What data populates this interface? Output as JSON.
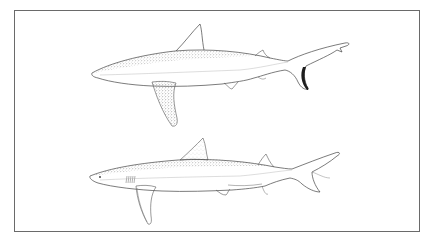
{
  "figure": {
    "frame_color": "#6a6a6a",
    "ink_color": "#3a3a3a",
    "stipple_color": "#555555",
    "dark_tail_accent": "#1e1e1e",
    "subjects": [
      {
        "position": "top",
        "label": "shark-upper",
        "orientation": "facing-left",
        "features": [
          "first-dorsal-fin",
          "long-pectoral-fin-stippled",
          "second-dorsal-fin",
          "pelvic-fin",
          "anal-fin",
          "dark-lower-caudal-lobe-edge"
        ]
      },
      {
        "position": "bottom",
        "label": "shark-lower",
        "orientation": "facing-left",
        "features": [
          "first-dorsal-fin-stippled",
          "gill-slits",
          "eye",
          "pectoral-fin",
          "second-dorsal-fin",
          "pelvic-fin",
          "anal-fin",
          "caudal-fin"
        ]
      }
    ]
  }
}
